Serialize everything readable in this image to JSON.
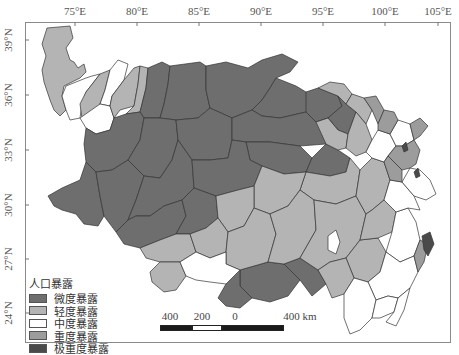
{
  "axes": {
    "x_ticks": [
      {
        "label": "75°E",
        "x": 75
      },
      {
        "label": "80°E",
        "x": 137
      },
      {
        "label": "85°E",
        "x": 199
      },
      {
        "label": "90°E",
        "x": 261
      },
      {
        "label": "95°E",
        "x": 323
      },
      {
        "label": "100°E",
        "x": 385
      },
      {
        "label": "105°E",
        "x": 438
      }
    ],
    "y_ticks": [
      {
        "label": "39°N",
        "y": 40
      },
      {
        "label": "36°N",
        "y": 95
      },
      {
        "label": "33°N",
        "y": 150
      },
      {
        "label": "30°N",
        "y": 205
      },
      {
        "label": "27°N",
        "y": 259
      },
      {
        "label": "24°N",
        "y": 313
      }
    ]
  },
  "legend": {
    "title": "人口暴露",
    "items": [
      {
        "label": "微度暴露",
        "color": "#6e6e6e"
      },
      {
        "label": "轻度暴露",
        "color": "#b4b4b4"
      },
      {
        "label": "中度暴露",
        "color": "#ffffff"
      },
      {
        "label": "重度暴露",
        "color": "#9c9c9c"
      },
      {
        "label": "极重度暴露",
        "color": "#4a4a4a"
      }
    ]
  },
  "scalebar": {
    "labels": [
      "400",
      "200",
      "0",
      "400 km"
    ],
    "unit": "km"
  },
  "colors": {
    "slight": "#6e6e6e",
    "light": "#b4b4b4",
    "moderate": "#ffffff",
    "heavy": "#9c9c9c",
    "extreme": "#4a4a4a",
    "border": "#333333"
  }
}
